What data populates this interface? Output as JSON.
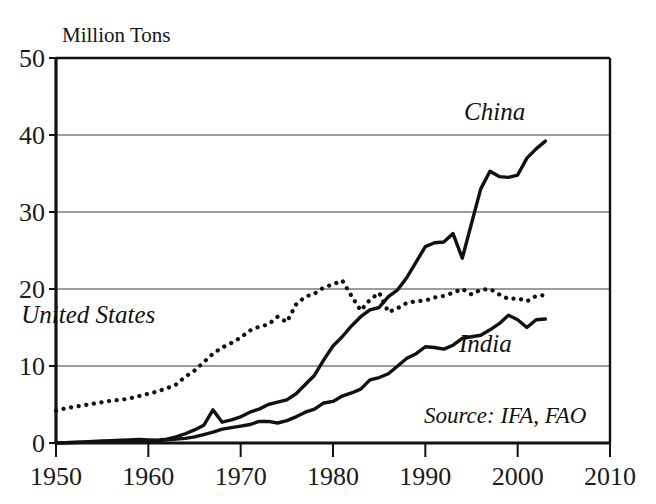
{
  "chart_data": {
    "type": "line",
    "title": "",
    "ylabel": "Million Tons",
    "xlabel": "",
    "xlim": [
      1950,
      2010
    ],
    "ylim": [
      0,
      50
    ],
    "xticks": [
      1950,
      1960,
      1970,
      1980,
      1990,
      2000,
      2010
    ],
    "yticks": [
      0,
      10,
      20,
      30,
      40,
      50
    ],
    "grid": "horizontal",
    "legend_position": "inline-annotations",
    "annotations": [
      {
        "text": "Source: IFA, FAO",
        "x": 1993.5,
        "y": 4.6,
        "style": "italic"
      }
    ],
    "series": [
      {
        "name": "China",
        "label": "China",
        "style": "solid",
        "color": "#111111",
        "label_x": 1997.5,
        "label_y": 42.0,
        "x": [
          1950,
          1951,
          1952,
          1953,
          1954,
          1955,
          1956,
          1957,
          1958,
          1959,
          1960,
          1961,
          1962,
          1963,
          1964,
          1965,
          1966,
          1967,
          1968,
          1969,
          1970,
          1971,
          1972,
          1973,
          1974,
          1975,
          1976,
          1977,
          1978,
          1979,
          1980,
          1981,
          1982,
          1983,
          1984,
          1985,
          1986,
          1987,
          1988,
          1989,
          1990,
          1991,
          1992,
          1993,
          1994,
          1995,
          1996,
          1997,
          1998,
          1999,
          2000,
          2001,
          2002,
          2003
        ],
        "y": [
          0.0,
          0.05,
          0.1,
          0.15,
          0.2,
          0.25,
          0.3,
          0.35,
          0.4,
          0.45,
          0.4,
          0.35,
          0.5,
          0.8,
          1.2,
          1.7,
          2.3,
          4.3,
          2.7,
          3.0,
          3.4,
          4.0,
          4.4,
          5.0,
          5.3,
          5.6,
          6.4,
          7.6,
          8.8,
          10.8,
          12.6,
          13.8,
          15.2,
          16.4,
          17.3,
          17.6,
          19.0,
          19.9,
          21.5,
          23.5,
          25.5,
          26.0,
          26.1,
          27.2,
          24.0,
          28.5,
          33.0,
          35.3,
          34.6,
          34.5,
          34.8,
          37.0,
          38.2,
          39.2
        ]
      },
      {
        "name": "United States",
        "label": "United States",
        "style": "dotted",
        "color": "#111111",
        "label_x": 1953.5,
        "label_y": 15.6,
        "x": [
          1950,
          1951,
          1952,
          1953,
          1954,
          1955,
          1956,
          1957,
          1958,
          1959,
          1960,
          1961,
          1962,
          1963,
          1964,
          1965,
          1966,
          1967,
          1968,
          1969,
          1970,
          1971,
          1972,
          1973,
          1974,
          1975,
          1976,
          1977,
          1978,
          1979,
          1980,
          1981,
          1982,
          1983,
          1984,
          1985,
          1986,
          1987,
          1988,
          1989,
          1990,
          1991,
          1992,
          1993,
          1994,
          1995,
          1996,
          1997,
          1998,
          1999,
          2000,
          2001,
          2002,
          2003
        ],
        "y": [
          4.2,
          4.5,
          4.7,
          4.9,
          5.1,
          5.3,
          5.5,
          5.6,
          5.8,
          6.1,
          6.4,
          6.7,
          7.1,
          7.6,
          8.6,
          9.4,
          10.5,
          11.6,
          12.4,
          13.0,
          13.7,
          14.6,
          15.1,
          15.4,
          16.4,
          15.7,
          18.0,
          19.0,
          19.4,
          20.2,
          20.6,
          21.1,
          19.1,
          17.2,
          18.6,
          19.5,
          17.0,
          17.5,
          18.2,
          18.4,
          18.5,
          18.9,
          19.1,
          19.5,
          20.0,
          19.3,
          19.9,
          20.0,
          19.3,
          18.7,
          18.8,
          18.4,
          19.1,
          19.2
        ]
      },
      {
        "name": "India",
        "label": "India",
        "style": "solid",
        "color": "#111111",
        "label_x": 1996.5,
        "label_y": 11.8,
        "x": [
          1950,
          1951,
          1952,
          1953,
          1954,
          1955,
          1956,
          1957,
          1958,
          1959,
          1960,
          1961,
          1962,
          1963,
          1964,
          1965,
          1966,
          1967,
          1968,
          1969,
          1970,
          1971,
          1972,
          1973,
          1974,
          1975,
          1976,
          1977,
          1978,
          1979,
          1980,
          1981,
          1982,
          1983,
          1984,
          1985,
          1986,
          1987,
          1988,
          1989,
          1990,
          1991,
          1992,
          1993,
          1994,
          1995,
          1996,
          1997,
          1998,
          1999,
          2000,
          2001,
          2002,
          2003
        ],
        "y": [
          0.0,
          0.02,
          0.05,
          0.08,
          0.1,
          0.15,
          0.2,
          0.25,
          0.3,
          0.35,
          0.3,
          0.3,
          0.4,
          0.5,
          0.6,
          0.8,
          1.1,
          1.4,
          1.8,
          2.0,
          2.2,
          2.4,
          2.8,
          2.8,
          2.6,
          2.9,
          3.4,
          4.0,
          4.4,
          5.2,
          5.4,
          6.1,
          6.5,
          7.0,
          8.2,
          8.5,
          9.0,
          10.0,
          11.0,
          11.6,
          12.5,
          12.4,
          12.2,
          12.7,
          13.6,
          13.8,
          14.0,
          14.7,
          15.5,
          16.6,
          16.0,
          15.0,
          16.0,
          16.1
        ]
      }
    ]
  },
  "axis": {
    "ylabel": "Million Tons",
    "yticks": [
      "0",
      "10",
      "20",
      "30",
      "40",
      "50"
    ],
    "xticks": [
      "1950",
      "1960",
      "1970",
      "1980",
      "1990",
      "2000",
      "2010"
    ]
  },
  "labels": {
    "china": "China",
    "united_states": "United States",
    "india": "India",
    "source": "Source: IFA, FAO"
  },
  "colors": {
    "ink": "#111111",
    "grid": "#3a3a3a",
    "background": "#ffffff"
  }
}
